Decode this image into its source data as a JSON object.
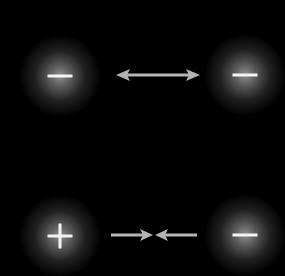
{
  "diagram": {
    "colors": {
      "background": "#000000",
      "glow": "#969696",
      "symbol": "#f4f4f4",
      "arrow": "#b4b4b4"
    },
    "rows": [
      {
        "name": "repulsion",
        "left_charge": {
          "sign": "−",
          "type": "negative",
          "x": 60,
          "y": 76
        },
        "right_charge": {
          "sign": "−",
          "type": "negative",
          "x": 245,
          "y": 75
        },
        "arrow": {
          "style": "double-headed-outward",
          "x1": 116,
          "x2": 200,
          "y": 75
        }
      },
      {
        "name": "attraction",
        "left_charge": {
          "sign": "+",
          "type": "positive",
          "x": 60,
          "y": 236
        },
        "right_charge": {
          "sign": "−",
          "type": "negative",
          "x": 245,
          "y": 235
        },
        "arrow": {
          "style": "converging-inward",
          "x1": 111,
          "x2": 197,
          "meet": 154,
          "y": 235
        }
      }
    ]
  }
}
